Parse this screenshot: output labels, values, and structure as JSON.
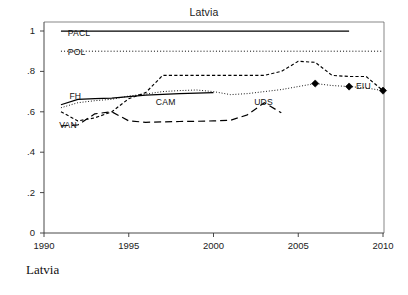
{
  "figure": {
    "title": "Latvia",
    "caption": "Latvia"
  },
  "chart_data": {
    "type": "line",
    "title": "Latvia",
    "xlabel": "",
    "ylabel": "",
    "xlim": [
      1990,
      2010
    ],
    "ylim": [
      0,
      1
    ],
    "xticks": [
      "1990",
      "1995",
      "2000",
      "2005",
      "2010"
    ],
    "yticks": [
      "0",
      ".2",
      ".4",
      ".6",
      ".8",
      "1"
    ],
    "xtick_values": [
      1990,
      1995,
      2000,
      2005,
      2010
    ],
    "ytick_values": [
      0,
      0.2,
      0.4,
      0.6,
      0.8,
      1
    ],
    "grid": false,
    "legend": "inline-labels",
    "series": [
      {
        "name": "PACL",
        "label": "PACL",
        "style": "solid",
        "color": "#000000",
        "x": [
          1991,
          1992,
          1993,
          1994,
          1995,
          1996,
          1997,
          1998,
          1999,
          2000,
          2001,
          2002,
          2003,
          2004,
          2005,
          2006,
          2007,
          2008
        ],
        "values": [
          1,
          1,
          1,
          1,
          1,
          1,
          1,
          1,
          1,
          1,
          1,
          1,
          1,
          1,
          1,
          1,
          1,
          1
        ]
      },
      {
        "name": "POL",
        "label": "POL",
        "style": "dotted",
        "color": "#000000",
        "x": [
          1991,
          1992,
          1993,
          1994,
          1995,
          1996,
          1997,
          1998,
          1999,
          2000,
          2001,
          2002,
          2003,
          2004,
          2005,
          2006,
          2007,
          2008,
          2009,
          2010
        ],
        "values": [
          0.9,
          0.9,
          0.9,
          0.9,
          0.9,
          0.9,
          0.9,
          0.9,
          0.9,
          0.9,
          0.9,
          0.9,
          0.9,
          0.9,
          0.9,
          0.9,
          0.9,
          0.9,
          0.9,
          0.9
        ]
      },
      {
        "name": "FH",
        "label": "FH",
        "style": "dashed",
        "color": "#000000",
        "x": [
          1991,
          1992,
          1993,
          1994,
          1995,
          1996,
          1997,
          1998,
          1999,
          2000,
          2001,
          2002,
          2003,
          2004,
          2005,
          2006,
          2007,
          2008,
          2009,
          2010
        ],
        "values": [
          0.6,
          0.555,
          0.57,
          0.6,
          0.665,
          0.695,
          0.78,
          0.78,
          0.78,
          0.78,
          0.78,
          0.78,
          0.78,
          0.8,
          0.85,
          0.845,
          0.78,
          0.775,
          0.775,
          0.705
        ]
      },
      {
        "name": "CAM",
        "label": "CAM",
        "style": "solid",
        "color": "#000000",
        "x": [
          1991,
          1992,
          1993,
          1994,
          1995,
          1996,
          1997,
          1998,
          1999,
          2000
        ],
        "values": [
          0.635,
          0.662,
          0.665,
          0.668,
          0.675,
          0.682,
          0.686,
          0.69,
          0.693,
          0.695
        ]
      },
      {
        "name": "UDS",
        "label": "UDS",
        "style": "dotted-fine",
        "color": "#000000",
        "x": [
          1991,
          1992,
          1993,
          1994,
          1995,
          1996,
          1997,
          1998,
          1999,
          2000,
          2001,
          2002,
          2003,
          2004,
          2005,
          2006,
          2007,
          2008,
          2009,
          2010
        ],
        "values": [
          0.62,
          0.645,
          0.655,
          0.662,
          0.678,
          0.688,
          0.7,
          0.705,
          0.708,
          0.7,
          0.685,
          0.69,
          0.7,
          0.71,
          0.725,
          0.74,
          0.73,
          0.725,
          0.718,
          0.705
        ]
      },
      {
        "name": "VAN",
        "label": "VAN",
        "style": "long-dashed",
        "color": "#000000",
        "x": [
          1991,
          1992,
          1993,
          1994,
          1995,
          1996,
          1997,
          1998,
          1999,
          2000,
          2001,
          2002,
          2003,
          2004
        ],
        "values": [
          0.53,
          0.535,
          0.59,
          0.6,
          0.555,
          0.548,
          0.55,
          0.552,
          0.553,
          0.555,
          0.558,
          0.585,
          0.645,
          0.595
        ]
      },
      {
        "name": "EIU",
        "label": "EIU",
        "style": "markers",
        "marker": "diamond",
        "color": "#000000",
        "x": [
          2006,
          2008,
          2010
        ],
        "values": [
          0.74,
          0.725,
          0.705
        ]
      }
    ],
    "annotations": [
      {
        "text": "PACL",
        "x": 1991.4,
        "y": 0.985
      },
      {
        "text": "POL",
        "x": 1991.4,
        "y": 0.893
      },
      {
        "text": "FH",
        "x": 1991.5,
        "y": 0.672
      },
      {
        "text": "VAN",
        "x": 1990.9,
        "y": 0.528
      },
      {
        "text": "CAM",
        "x": 1996.6,
        "y": 0.645
      },
      {
        "text": "UDS",
        "x": 2002.4,
        "y": 0.645
      },
      {
        "text": "EIU",
        "x": 2008.4,
        "y": 0.725
      }
    ]
  }
}
